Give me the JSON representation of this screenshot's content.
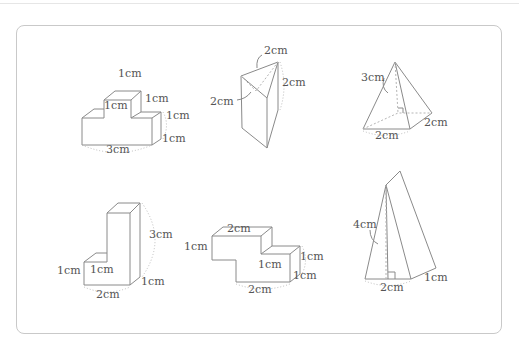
{
  "figures": [
    {
      "id": "l-block-3cm",
      "shape": "stepped rectangular solid",
      "labels": {
        "top_width": "1cm",
        "inner_height": "1cm",
        "step_depth": "1cm",
        "right_height": "1cm",
        "depth": "1cm",
        "base_length": "3cm"
      }
    },
    {
      "id": "triangular-prism",
      "shape": "triangular prism",
      "labels": {
        "top_edge": "2cm",
        "height": "2cm",
        "base_edge": "2cm"
      }
    },
    {
      "id": "square-pyramid",
      "shape": "pyramid",
      "labels": {
        "height": "3cm",
        "base_front": "2cm",
        "base_side": "2cm"
      }
    },
    {
      "id": "l-block-tall",
      "shape": "L-shaped solid",
      "labels": {
        "height": "3cm",
        "step_height": "1cm",
        "step_width": "1cm",
        "depth": "1cm",
        "base_length": "2cm"
      }
    },
    {
      "id": "z-block",
      "shape": "Z-shaped solid",
      "labels": {
        "top_length": "2cm",
        "left_height": "1cm",
        "inner_height": "1cm",
        "right_height": "1cm",
        "depth": "1cm",
        "base_length": "2cm"
      }
    },
    {
      "id": "triangular-prism-tall",
      "shape": "triangular prism (standing)",
      "labels": {
        "height": "4cm",
        "base_edge": "2cm",
        "depth": "1cm"
      }
    }
  ],
  "colors": {
    "line": "#8a8a8a",
    "text": "#555555",
    "frame": "#c9c9c9",
    "background": "#ffffff"
  }
}
